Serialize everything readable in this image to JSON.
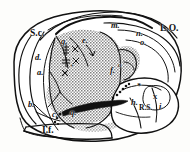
{
  "figure": {
    "kind": "anatomical-engraving",
    "style": "stipple-and-line engraving",
    "background_color": "#fdfdfb",
    "ink_color": "#101010",
    "shaded_region_fill": "#b9b9b9"
  },
  "labels": {
    "sulcus_centralis": "S.c.",
    "d": "d.",
    "a": "a.",
    "b": "b.",
    "c": "c.",
    "fissura_lateralis": "I.f.",
    "m": "m.",
    "n": "n.",
    "o": "o.",
    "lobus_occipitalis": "L.O.",
    "g": "g.",
    "e": "e.",
    "r": "r",
    "r_sup": "o",
    "h": "h.",
    "rs": "R.S.",
    "i": "i.",
    "x": "x",
    "q": "q.",
    "f": "f."
  },
  "markers": {
    "asterisk": "*",
    "cross": "+",
    "dot": "•",
    "star_small": "✱"
  }
}
